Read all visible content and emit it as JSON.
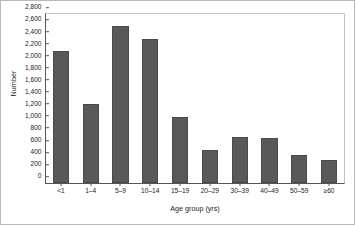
{
  "chart_data": {
    "type": "bar",
    "title": "",
    "xlabel": "Age group (yrs)",
    "ylabel": "Number",
    "categories": [
      "<1",
      "1–4",
      "5–9",
      "10–14",
      "15–19",
      "20–29",
      "30–39",
      "40–49",
      "50–59",
      "≥60"
    ],
    "values": [
      2180,
      1310,
      2600,
      2390,
      1100,
      540,
      770,
      740,
      460,
      380
    ],
    "ylim": [
      0,
      2800
    ],
    "ytick_step": 200,
    "yticks": [
      0,
      200,
      400,
      600,
      800,
      1000,
      1200,
      1400,
      1600,
      1800,
      2000,
      2200,
      2400,
      2600,
      2800
    ],
    "ytick_labels": [
      "0",
      "200",
      "400",
      "600",
      "800",
      "1,000",
      "1,200",
      "1,400",
      "1,600",
      "1,800",
      "2,000",
      "2,200",
      "2,400",
      "2,600",
      "2,800"
    ],
    "grid": false,
    "legend": false,
    "bar_color": "#595959",
    "axis_color": "#555555",
    "frame_color": "#b9b9b9",
    "background": "#ffffff"
  }
}
